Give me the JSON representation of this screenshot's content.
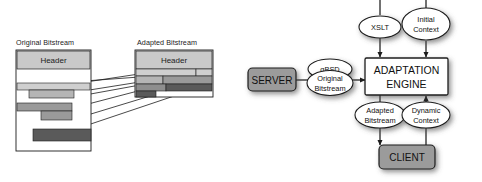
{
  "figure": {
    "panels": [
      {
        "id": "bitstream-adaptation",
        "streams": [
          {
            "id": "original",
            "title": "Original Bitstream",
            "header_label": "Header"
          },
          {
            "id": "adapted",
            "title": "Adapted Bitstream",
            "header_label": "Header"
          }
        ]
      },
      {
        "id": "adaptation-architecture",
        "nodes": [
          {
            "id": "server",
            "label": "SERVER",
            "shape": "rounded-rect",
            "fill": "#9b9b9b"
          },
          {
            "id": "gbsd",
            "label": "gBSD",
            "shape": "ellipse",
            "fill": "#ffffff"
          },
          {
            "id": "original-bitstream",
            "label_line1": "Original",
            "label_line2": "Bitstream",
            "shape": "ellipse",
            "fill": "#ffffff"
          },
          {
            "id": "xslt",
            "label": "XSLT",
            "shape": "ellipse",
            "fill": "#ffffff"
          },
          {
            "id": "initial-context",
            "label_line1": "Initial",
            "label_line2": "Context",
            "shape": "ellipse",
            "fill": "#ffffff"
          },
          {
            "id": "adaptation-engine",
            "label_line1": "ADAPTATION",
            "label_line2": "ENGINE",
            "shape": "rect",
            "fill": "#ffffff"
          },
          {
            "id": "adapted-bitstream",
            "label_line1": "Adapted",
            "label_line2": "Bitstream",
            "shape": "ellipse",
            "fill": "#ffffff"
          },
          {
            "id": "dynamic-context",
            "label_line1": "Dynamic",
            "label_line2": "Context",
            "shape": "ellipse",
            "fill": "#ffffff"
          },
          {
            "id": "client",
            "label": "CLIENT",
            "shape": "rounded-rect",
            "fill": "#9b9b9b"
          }
        ]
      }
    ]
  },
  "colors": {
    "outline": "#1c1c1c",
    "header_fill": "#c9c9c9",
    "band_light": "#cfcfcf",
    "band_mid": "#9a9a9a",
    "band_dark": "#5a5a5a",
    "node_gray": "#9b9b9b",
    "node_white": "#ffffff",
    "page_background": "#ffffff"
  }
}
